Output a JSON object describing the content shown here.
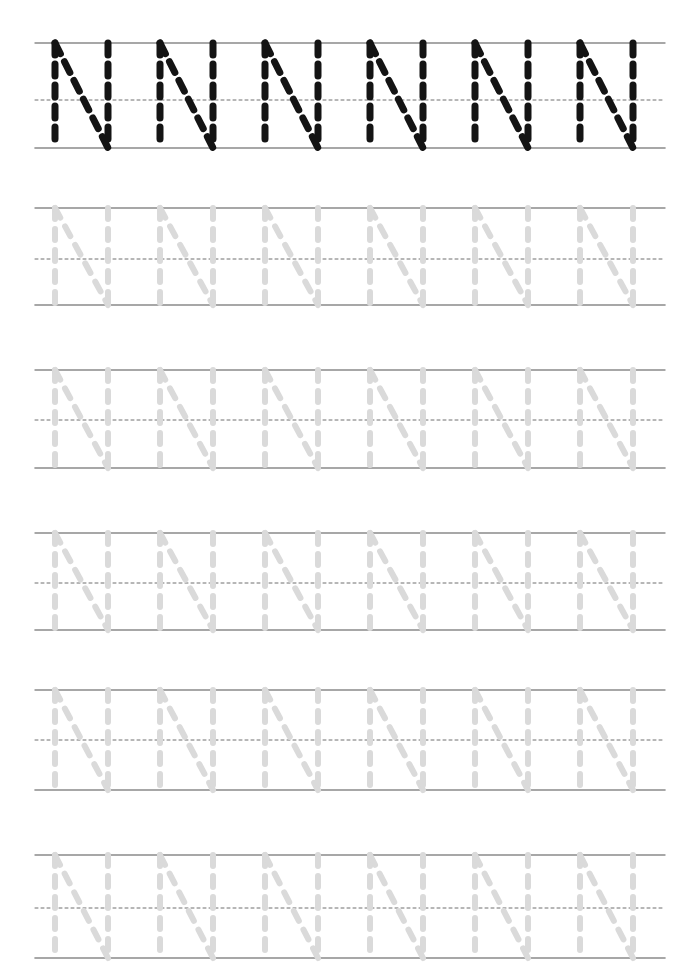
{
  "worksheet": {
    "letter": "N",
    "letter_case": "uppercase",
    "title": "Letter N Tracing Practice Worksheet",
    "page_width": 700,
    "page_height": 980,
    "background_color": "#ffffff",
    "rows_count": 6,
    "letters_per_row": 6
  },
  "colors": {
    "model_stroke": "#141414",
    "trace_stroke": "#dadada",
    "guide_line_solid": "#8a8a8a",
    "guide_line_dashed": "#6f6f6f",
    "paper": "#ffffff"
  },
  "geometry": {
    "guide_left_x": 35,
    "guide_right_x": 665,
    "letter_start_x": 55,
    "letter_advance_x": 105,
    "letter_width": 53,
    "model_stroke_width": 7,
    "trace_stroke_width": 6,
    "model_dash": "12 9",
    "trace_dash": "11 10"
  },
  "rows": [
    {
      "index": 1,
      "kind": "model",
      "style": "dark",
      "label": "model-row",
      "top_line_y": 43,
      "mid_line_y": 100,
      "base_line_y": 148,
      "letters": [
        "N",
        "N",
        "N",
        "N",
        "N",
        "N"
      ]
    },
    {
      "index": 2,
      "kind": "trace",
      "style": "light",
      "label": "tracing-row",
      "top_line_y": 208,
      "mid_line_y": 259,
      "base_line_y": 305,
      "letters": [
        "N",
        "N",
        "N",
        "N",
        "N",
        "N"
      ]
    },
    {
      "index": 3,
      "kind": "trace",
      "style": "light",
      "label": "tracing-row",
      "top_line_y": 370,
      "mid_line_y": 420,
      "base_line_y": 468,
      "letters": [
        "N",
        "N",
        "N",
        "N",
        "N",
        "N"
      ]
    },
    {
      "index": 4,
      "kind": "trace",
      "style": "light",
      "label": "tracing-row",
      "top_line_y": 533,
      "mid_line_y": 583,
      "base_line_y": 630,
      "letters": [
        "N",
        "N",
        "N",
        "N",
        "N",
        "N"
      ]
    },
    {
      "index": 5,
      "kind": "trace",
      "style": "light",
      "label": "tracing-row",
      "top_line_y": 690,
      "mid_line_y": 740,
      "base_line_y": 790,
      "letters": [
        "N",
        "N",
        "N",
        "N",
        "N",
        "N"
      ]
    },
    {
      "index": 6,
      "kind": "trace",
      "style": "light",
      "label": "tracing-row",
      "top_line_y": 855,
      "mid_line_y": 908,
      "base_line_y": 958,
      "letters": [
        "N",
        "N",
        "N",
        "N",
        "N",
        "N"
      ]
    }
  ],
  "letter_strokes": {
    "N": [
      {
        "name": "left-vertical",
        "from": [
          0,
          0
        ],
        "to": [
          0,
          1
        ]
      },
      {
        "name": "diagonal",
        "from": [
          0,
          0
        ],
        "to": [
          1,
          1
        ]
      },
      {
        "name": "right-vertical",
        "from": [
          1,
          0
        ],
        "to": [
          1,
          1
        ]
      }
    ]
  }
}
